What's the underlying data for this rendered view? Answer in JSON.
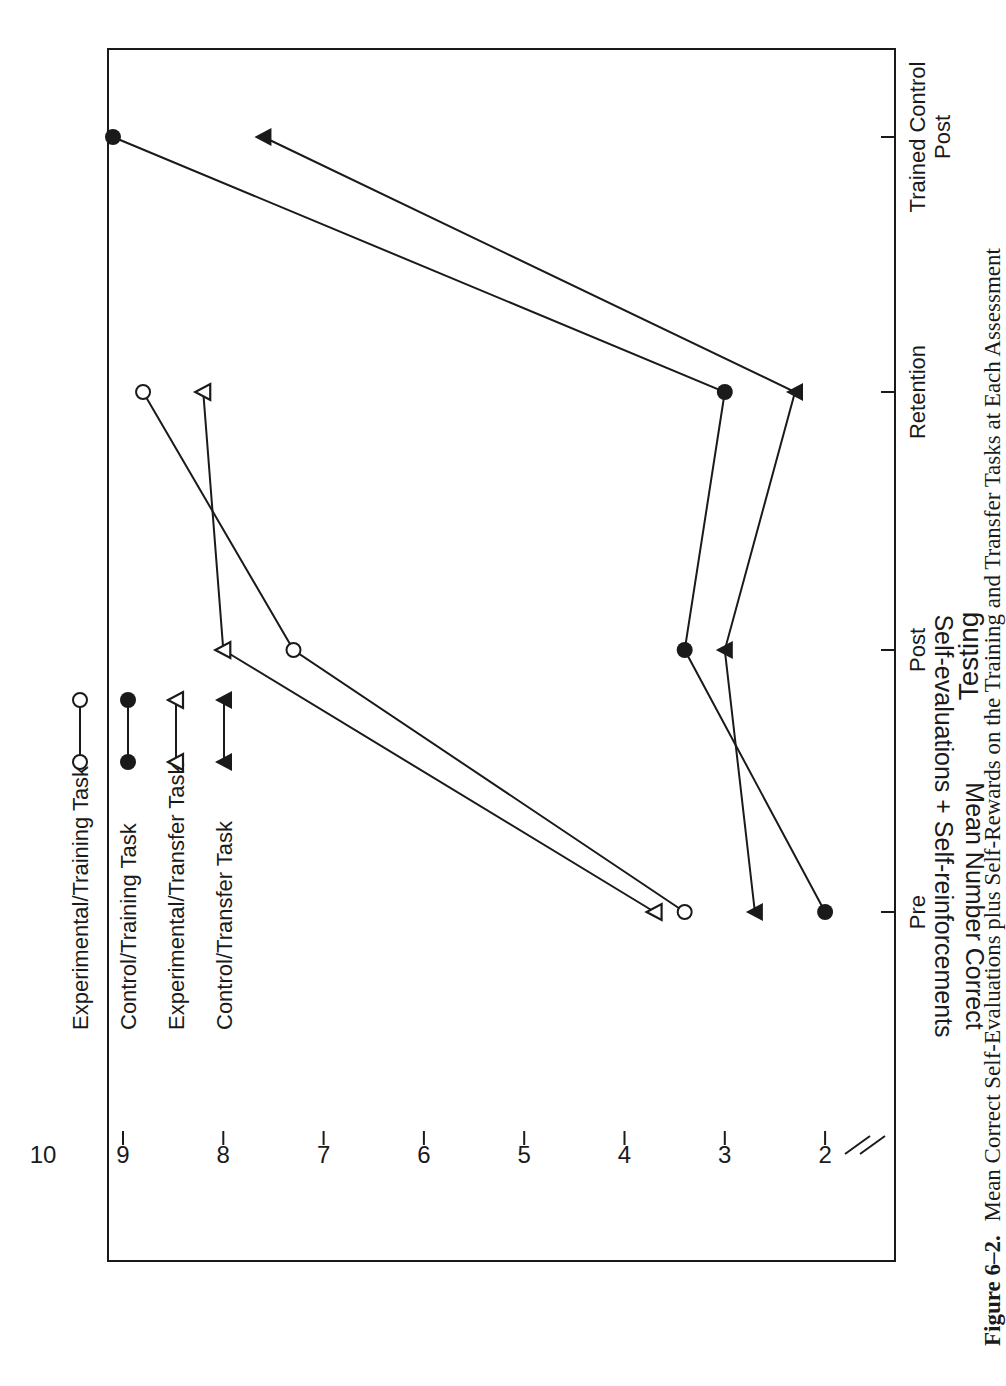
{
  "figure": {
    "caption_label": "Figure 6–2.",
    "caption_text": "Mean Correct Self-Evaluations plus Self-Rewards on the Training and Transfer Tasks at Each Assessment"
  },
  "axes": {
    "ylabel_line1": "Mean Number Correct",
    "ylabel_line2": "Self-evaluations + Self-reinforcements",
    "xlabel": "Testing",
    "y_ticks": [
      "2",
      "3",
      "4",
      "5",
      "6",
      "7",
      "8",
      "9",
      "10"
    ],
    "x_ticks": [
      {
        "line1": "Pre",
        "line2": ""
      },
      {
        "line1": "Post",
        "line2": ""
      },
      {
        "line1": "Retention",
        "line2": ""
      },
      {
        "line1": "Trained Control",
        "line2": "Post"
      }
    ]
  },
  "legend": [
    {
      "label": "Experimental/Training Task",
      "marker": "open-circle"
    },
    {
      "label": "Control/Training Task",
      "marker": "filled-circle"
    },
    {
      "label": "Experimental/Transfer Task",
      "marker": "open-triangle"
    },
    {
      "label": "Control/Transfer Task",
      "marker": "filled-triangle"
    }
  ],
  "chart_data": {
    "type": "line",
    "title": "Mean Correct Self-Evaluations plus Self-Rewards on the Training and Transfer Tasks at Each Assessment",
    "xlabel": "Testing",
    "ylabel": "Mean Number Correct Self-evaluations + Self-reinforcements",
    "categories": [
      "Pre",
      "Post",
      "Retention",
      "Trained Control Post"
    ],
    "ylim": [
      2,
      10
    ],
    "y_axis_break": true,
    "grid": false,
    "legend_position": "upper-left (rotated figure)",
    "orientation": "figure rotated 90° counter-clockwise on page",
    "series": [
      {
        "name": "Experimental/Training Task",
        "marker": "open-circle",
        "values": [
          3.4,
          7.3,
          8.8,
          null
        ]
      },
      {
        "name": "Control/Training Task",
        "marker": "filled-circle",
        "values": [
          2.0,
          3.4,
          3.0,
          9.1
        ]
      },
      {
        "name": "Experimental/Transfer Task",
        "marker": "open-triangle",
        "values": [
          3.7,
          8.0,
          8.2,
          null
        ]
      },
      {
        "name": "Control/Transfer Task",
        "marker": "filled-triangle",
        "values": [
          2.7,
          3.0,
          2.3,
          7.6
        ]
      }
    ]
  }
}
